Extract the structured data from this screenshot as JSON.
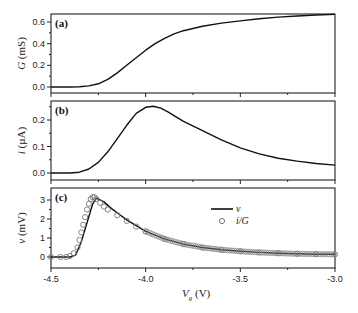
{
  "chart_data": [
    {
      "panel": "(a)",
      "type": "line",
      "ylabel": "G (mS)",
      "ylim": [
        -0.04,
        0.7
      ],
      "yticks": [
        "0.0",
        "0.2",
        "0.4",
        "0.6"
      ],
      "xlim": [
        -4.5,
        -3.0
      ],
      "series": [
        {
          "name": "G",
          "x": [
            -4.5,
            -4.4,
            -4.35,
            -4.3,
            -4.25,
            -4.2,
            -4.15,
            -4.1,
            -4.05,
            -4.0,
            -3.95,
            -3.9,
            -3.85,
            -3.8,
            -3.7,
            -3.6,
            -3.5,
            -3.4,
            -3.3,
            -3.2,
            -3.1,
            -3.0
          ],
          "y": [
            0.0,
            0.0,
            0.002,
            0.01,
            0.03,
            0.07,
            0.13,
            0.2,
            0.27,
            0.34,
            0.4,
            0.45,
            0.49,
            0.52,
            0.56,
            0.59,
            0.61,
            0.63,
            0.645,
            0.655,
            0.665,
            0.67
          ]
        }
      ]
    },
    {
      "panel": "(b)",
      "type": "line",
      "ylabel": "i (µA)",
      "ylim": [
        -0.02,
        0.27
      ],
      "yticks": [
        "0.0",
        "0.1",
        "0.2"
      ],
      "xlim": [
        -4.5,
        -3.0
      ],
      "series": [
        {
          "name": "i",
          "x": [
            -4.5,
            -4.4,
            -4.35,
            -4.3,
            -4.25,
            -4.2,
            -4.15,
            -4.1,
            -4.05,
            -4.0,
            -3.96,
            -3.92,
            -3.88,
            -3.84,
            -3.8,
            -3.7,
            -3.6,
            -3.5,
            -3.4,
            -3.3,
            -3.2,
            -3.1,
            -3.0
          ],
          "y": [
            0.0,
            0.0,
            0.003,
            0.015,
            0.04,
            0.08,
            0.13,
            0.18,
            0.225,
            0.248,
            0.252,
            0.245,
            0.23,
            0.212,
            0.195,
            0.16,
            0.125,
            0.095,
            0.072,
            0.056,
            0.045,
            0.036,
            0.03
          ]
        }
      ]
    },
    {
      "panel": "(c)",
      "type": "line",
      "ylabel": "v (mV)",
      "xlabel": "Vg (V)",
      "ylim": [
        -0.4,
        3.4
      ],
      "yticks": [
        "0",
        "1",
        "2",
        "3"
      ],
      "xlim": [
        -4.5,
        -3.0
      ],
      "xticks": [
        "-4.5",
        "-4.0",
        "-3.5",
        "-3.0"
      ],
      "legend": [
        "v",
        "i/G"
      ],
      "series": [
        {
          "name": "v",
          "style": "line",
          "x": [
            -4.5,
            -4.4,
            -4.37,
            -4.34,
            -4.31,
            -4.28,
            -4.26,
            -4.22,
            -4.18,
            -4.14,
            -4.1,
            -4.0,
            -3.9,
            -3.8,
            -3.7,
            -3.6,
            -3.5,
            -3.4,
            -3.3,
            -3.2,
            -3.1,
            -3.0
          ],
          "y": [
            0.0,
            0.0,
            0.1,
            0.8,
            1.8,
            2.8,
            3.1,
            2.9,
            2.55,
            2.25,
            1.95,
            1.35,
            0.95,
            0.68,
            0.5,
            0.38,
            0.3,
            0.24,
            0.2,
            0.17,
            0.15,
            0.14
          ]
        },
        {
          "name": "i/G",
          "style": "circles",
          "x": [
            -4.5,
            -4.45,
            -4.42,
            -4.4,
            -4.38,
            -4.36,
            -4.35,
            -4.34,
            -4.33,
            -4.32,
            -4.31,
            -4.3,
            -4.29,
            -4.28,
            -4.27,
            -4.26,
            -4.24,
            -4.22,
            -4.2,
            -4.15,
            -4.1,
            -4.05,
            -4.0,
            -3.9,
            -3.8,
            -3.7,
            -3.6,
            -3.5,
            -3.4,
            -3.3,
            -3.2,
            -3.1,
            -3.0
          ],
          "y": [
            0.0,
            0.0,
            0.0,
            0.05,
            0.2,
            0.5,
            0.9,
            1.3,
            1.7,
            2.1,
            2.5,
            2.8,
            3.05,
            3.15,
            3.15,
            3.05,
            2.85,
            2.65,
            2.5,
            2.2,
            1.9,
            1.6,
            1.35,
            0.95,
            0.68,
            0.5,
            0.38,
            0.3,
            0.24,
            0.2,
            0.17,
            0.15,
            0.14
          ]
        }
      ]
    }
  ],
  "labels": {
    "panel_a": "(a)",
    "panel_b": "(b)",
    "panel_c": "(c)",
    "ylabel_a_var": "G",
    "ylabel_a_unit": " (mS)",
    "ylabel_b_var": "i",
    "ylabel_b_unit": " (µA)",
    "ylabel_c_var": "v",
    "ylabel_c_unit": " (mV)",
    "xlabel_var": "V",
    "xlabel_sub": "g",
    "xlabel_unit": " (V)",
    "legend_v": "v",
    "legend_iG": "i/G"
  }
}
